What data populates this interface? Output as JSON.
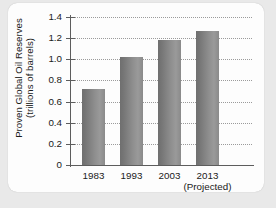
{
  "chart_data": {
    "type": "bar",
    "title": "",
    "xlabel": "",
    "ylabel_line1": "Proven Global Oil Reserves",
    "ylabel_line2": "(trillions of barrels)",
    "categories": [
      "1983",
      "1993",
      "2003",
      "2013"
    ],
    "values": [
      0.72,
      1.02,
      1.18,
      1.27
    ],
    "annotations": [
      "(Projected)"
    ],
    "ylim": [
      0,
      1.4
    ],
    "yticks": [
      "0",
      "0.2",
      "0.4",
      "0.6",
      "0.8",
      "1.0",
      "1.2",
      "1.4"
    ],
    "ytick_values": [
      0,
      0.2,
      0.4,
      0.6,
      0.8,
      1.0,
      1.2,
      1.4
    ],
    "grid": "horizontal-dotted",
    "legend": "none",
    "bar_color": "#8c8c8c",
    "axis_color": "#5d5d5d",
    "grid_color": "#9b9b9b",
    "background": "#fdfdfd",
    "page_background": "#e9e9e9"
  }
}
